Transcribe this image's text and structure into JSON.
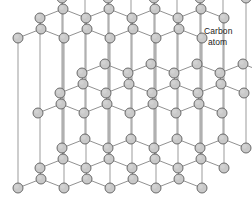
{
  "figure": {
    "name": "graphite-crystal-lattice",
    "title": ""
  },
  "annotations": [
    {
      "id": "carbon-atom-label",
      "line1": "Carbon",
      "line2": "atom",
      "x": 204,
      "y": 26
    }
  ],
  "style": {
    "background": "#ffffff",
    "atom_fill": "#c9c9c9",
    "atom_fill_light": "#d2d2d2",
    "atom_stroke": "#5e5e5e",
    "atom_radius": 5.0,
    "atom_stroke_width": 0.9,
    "bond_color": "#7d7d7d",
    "bond_width": 0.85,
    "pillar_color": "#8a8a8a",
    "pillar_width": 0.85,
    "text_color": "#1a1a1a"
  },
  "lattice": {
    "layers": [
      {
        "id": "top-layer",
        "label": "Top carbon sheet",
        "y_offset": 0,
        "x_offset": 0
      },
      {
        "id": "middle-layer",
        "label": "Middle carbon sheet",
        "y_offset": 75,
        "x_offset": 20
      },
      {
        "id": "bottom-layer",
        "label": "Bottom carbon sheet",
        "y_offset": 150,
        "x_offset": 0
      }
    ],
    "geometry": {
      "origin_x": 18,
      "origin_y": 38,
      "hex_width": 46,
      "hex_half_width": 23,
      "hex_rise": 9,
      "row_depth_dx": 22,
      "row_depth_dy": -20,
      "columns": 4,
      "rows": 3
    },
    "counts": {
      "layers": 3,
      "atoms_per_layer": 26,
      "total_atoms": 78
    }
  }
}
